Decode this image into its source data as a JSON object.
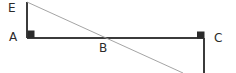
{
  "diagram": {
    "kind": "geometry-figure",
    "background_color": "#ffffff",
    "stroke_color_solid": "#3b3b3b",
    "stroke_color_diagonal": "#9a9a9a",
    "marker_color": "#2b2b2b",
    "label_color": "#2b2b2b",
    "labels": [
      {
        "id": "E",
        "text": "E",
        "x": 8,
        "y": 2
      },
      {
        "id": "A",
        "text": "A",
        "x": 9,
        "y": 31
      },
      {
        "id": "B",
        "text": "B",
        "x": 99,
        "y": 42
      },
      {
        "id": "C",
        "text": "C",
        "x": 214,
        "y": 32
      }
    ],
    "points": {
      "E": {
        "x": 27,
        "y": 2
      },
      "A": {
        "x": 27,
        "y": 38
      },
      "B": {
        "x": 104,
        "y": 38
      },
      "C": {
        "x": 204,
        "y": 38
      },
      "C_bottom": {
        "x": 204,
        "y": 73
      },
      "diagonal_end": {
        "x": 183,
        "y": 73
      }
    },
    "segments": [
      {
        "id": "segment-EA",
        "from": "E",
        "to": "A",
        "style": "solid",
        "width": 1.6
      },
      {
        "id": "segment-AC",
        "from": "A",
        "to": "C",
        "style": "solid",
        "width": 1.6
      },
      {
        "id": "segment-C-down",
        "from": "C",
        "to": "C_bottom",
        "style": "solid",
        "width": 1.6
      },
      {
        "id": "segment-diagonal-EB",
        "from": "E",
        "to": "diagonal_end",
        "style": "thin",
        "width": 0.9
      }
    ],
    "right_angle_markers": [
      {
        "id": "right-angle-A",
        "x": 27,
        "y": 31,
        "size": 7
      },
      {
        "id": "right-angle-C",
        "x": 197,
        "y": 32,
        "size": 7
      }
    ]
  }
}
